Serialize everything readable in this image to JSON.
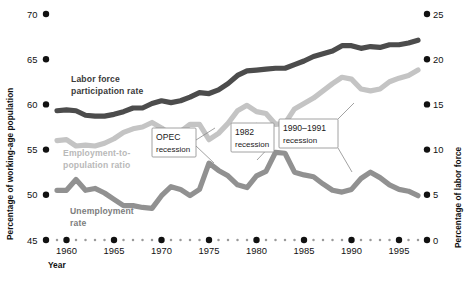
{
  "chart_data": {
    "type": "line",
    "title": "",
    "xlabel": "Year",
    "ylabel_left": "Percentage of working-age population",
    "ylabel_right": "Percentage of labor force",
    "xlim": [
      1959,
      1997
    ],
    "ylim_left": [
      45,
      70
    ],
    "ylim_right": [
      0,
      25
    ],
    "grid": false,
    "legend_position": "inline-labels",
    "x_major_ticks": [
      "1960",
      "1965",
      "1970",
      "1975",
      "1980",
      "1985",
      "1990",
      "1995"
    ],
    "y_left_ticks": [
      "45",
      "50",
      "55",
      "60",
      "65",
      "70"
    ],
    "y_right_ticks": [
      "0",
      "5",
      "10",
      "15",
      "20",
      "25"
    ],
    "x": [
      1959,
      1960,
      1961,
      1962,
      1963,
      1964,
      1965,
      1966,
      1967,
      1968,
      1969,
      1970,
      1971,
      1972,
      1973,
      1974,
      1975,
      1976,
      1977,
      1978,
      1979,
      1980,
      1981,
      1982,
      1983,
      1984,
      1985,
      1986,
      1987,
      1988,
      1989,
      1990,
      1991,
      1992,
      1993,
      1994,
      1995,
      1996,
      1997
    ],
    "series": [
      {
        "name": "Labor force participation rate",
        "axis": "left",
        "color": "#4c4c4c",
        "label_color": "#3a3a3a",
        "values": [
          59.3,
          59.4,
          59.3,
          58.8,
          58.7,
          58.7,
          58.9,
          59.2,
          59.6,
          59.6,
          60.1,
          60.4,
          60.2,
          60.4,
          60.8,
          61.3,
          61.2,
          61.6,
          62.3,
          63.2,
          63.7,
          63.8,
          63.9,
          64.0,
          64.0,
          64.4,
          64.8,
          65.3,
          65.6,
          65.9,
          66.5,
          66.5,
          66.2,
          66.4,
          66.3,
          66.6,
          66.6,
          66.8,
          67.1
        ]
      },
      {
        "name": "Employment-to-population ratio",
        "axis": "left",
        "color": "#c4c4c4",
        "label_color": "#b4b4b4",
        "values": [
          56.0,
          56.1,
          55.4,
          55.5,
          55.4,
          55.7,
          56.2,
          56.9,
          57.3,
          57.5,
          58.0,
          57.4,
          56.6,
          57.0,
          57.8,
          57.8,
          56.1,
          56.8,
          57.9,
          59.3,
          59.9,
          59.2,
          59.0,
          57.8,
          57.9,
          59.5,
          60.1,
          60.7,
          61.5,
          62.3,
          63.0,
          62.8,
          61.7,
          61.5,
          61.7,
          62.5,
          62.9,
          63.2,
          63.8
        ]
      },
      {
        "name": "Unemployment rate",
        "axis": "right",
        "color": "#919191",
        "label_color": "#7d7d7d",
        "values": [
          5.5,
          5.5,
          6.7,
          5.5,
          5.7,
          5.2,
          4.5,
          3.8,
          3.8,
          3.6,
          3.5,
          4.9,
          5.9,
          5.6,
          4.9,
          5.6,
          8.5,
          7.7,
          7.1,
          6.1,
          5.8,
          7.1,
          7.6,
          9.7,
          9.6,
          7.5,
          7.2,
          7.0,
          6.2,
          5.5,
          5.3,
          5.6,
          6.8,
          7.5,
          6.9,
          6.1,
          5.6,
          5.4,
          4.9
        ]
      }
    ],
    "annotations": [
      {
        "id": "opec-recession",
        "line1": "OPEC",
        "line2": "recession",
        "target_year": 1975
      },
      {
        "id": "1982-recession",
        "line1": "1982",
        "line2": "recession",
        "target_year": 1982
      },
      {
        "id": "1990-1991-recession",
        "line1": "1990–1991",
        "line2": "recession",
        "target_year": 1991
      }
    ]
  },
  "labels": {
    "y_left_title": "Percentage of working-age population",
    "y_right_title": "Percentage of labor force",
    "x_title": "Year",
    "series_1_line1": "Labor force",
    "series_1_line2": "participation rate",
    "series_2_line1": "Employment-to-",
    "series_2_line2": "population ratio",
    "series_3_line1": "Unemployment",
    "series_3_line2": "rate"
  },
  "ticks": {
    "left": [
      "70",
      "65",
      "60",
      "55",
      "50",
      "45"
    ],
    "right": [
      "25",
      "20",
      "15",
      "10",
      "5",
      "0"
    ],
    "bottom": [
      "1960",
      "1965",
      "1970",
      "1975",
      "1980",
      "1985",
      "1990",
      "1995"
    ]
  }
}
